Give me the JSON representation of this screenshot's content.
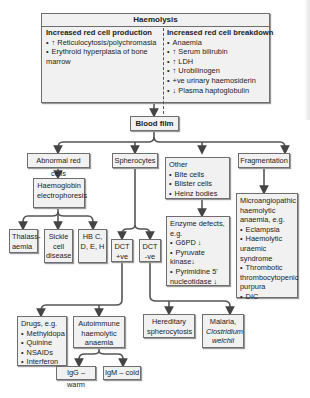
{
  "haemolysis": {
    "title": "Haemolysis",
    "production": {
      "title": "Increased red cell production",
      "items": [
        "↑ Reticulocytosis/polychromasia",
        "Erythroid hyperplasia of bone marrow"
      ]
    },
    "breakdown": {
      "title": "Increased red cell breakdown",
      "items": [
        "Anaemia",
        "↑ Serum bilirubin",
        "↑ LDH",
        "↑ Urobilinogen",
        "+ve urinary haemosiderin",
        "↓ Plasma haptoglobulin"
      ]
    }
  },
  "blood_film": "Blood film",
  "abnormal_red_cells": "Abnormal red cells",
  "hb_electrophoresis": "Haemoglobin electrophoresis",
  "thalassaemia": "Thalass-aemia",
  "sickle": "Sickle cell disease",
  "hb_cdeh": "HB C, D, E, H",
  "spherocytes": "Spherocytes",
  "dct_pos": "DCT +ve",
  "dct_neg": "DCT -ve",
  "drugs": {
    "title": "Drugs, e.g.",
    "items": [
      "Methyldopa",
      "Quinine",
      "NSAIDs",
      "Interferon"
    ]
  },
  "aiha": "Autoimmune haemolytic anaemia",
  "igg": "IgG – warm",
  "igm": "IgM – cold",
  "hereditary": "Hereditary spherocytosis",
  "malaria": {
    "line1": "Malaria,",
    "line2": "Clostridium welchii"
  },
  "other": {
    "title": "Other",
    "items": [
      "Bite cells",
      "Blister cells",
      "Heinz bodies"
    ]
  },
  "enzyme": {
    "title": "Enzyme defects, e.g.",
    "items": [
      "G6PD ↓",
      "Pyruvate kinase↓",
      "Pyrimidine 5' nucleotidase ↓"
    ]
  },
  "fragmentation": "Fragmentation",
  "mah": {
    "title": "Microangiopathic haemolytic anaemia, e.g.",
    "items": [
      "Eclampsia",
      "Haemolytic uraemic syndrome",
      "Thrombotic thrombocytopenic purpura",
      "DIC"
    ]
  }
}
